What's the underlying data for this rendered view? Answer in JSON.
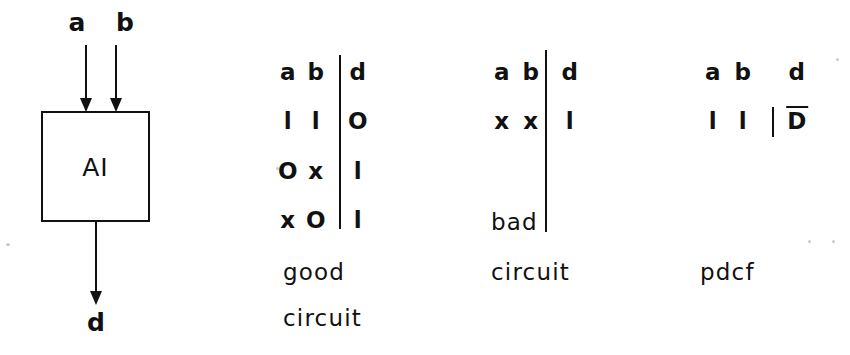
{
  "figure": {
    "ink_color": "#111111",
    "background_color": "#ffffff"
  },
  "diagram": {
    "block_label": "AI",
    "inputs": [
      {
        "label": "a"
      },
      {
        "label": "b"
      }
    ],
    "output": {
      "label": "d"
    }
  },
  "tables": [
    {
      "name": "good-circuit-table",
      "headers": [
        "a",
        "b",
        "d"
      ],
      "rows": [
        [
          "l",
          "l",
          "O"
        ],
        [
          "O",
          "x",
          "l"
        ],
        [
          "x",
          "O",
          "l"
        ]
      ],
      "captions": [
        "good",
        "circuit"
      ]
    },
    {
      "name": "bad-circuit-table",
      "headers": [
        "a",
        "b",
        "d"
      ],
      "rows": [
        [
          "x",
          "x",
          "l"
        ]
      ],
      "captions": [
        "bad",
        "circuit"
      ]
    },
    {
      "name": "pdcf-table",
      "headers": [
        "a",
        "b",
        "d"
      ],
      "rows": [
        [
          "l",
          "l",
          "D"
        ]
      ],
      "row_overbar": "D",
      "captions": [
        "pdcf"
      ]
    }
  ]
}
